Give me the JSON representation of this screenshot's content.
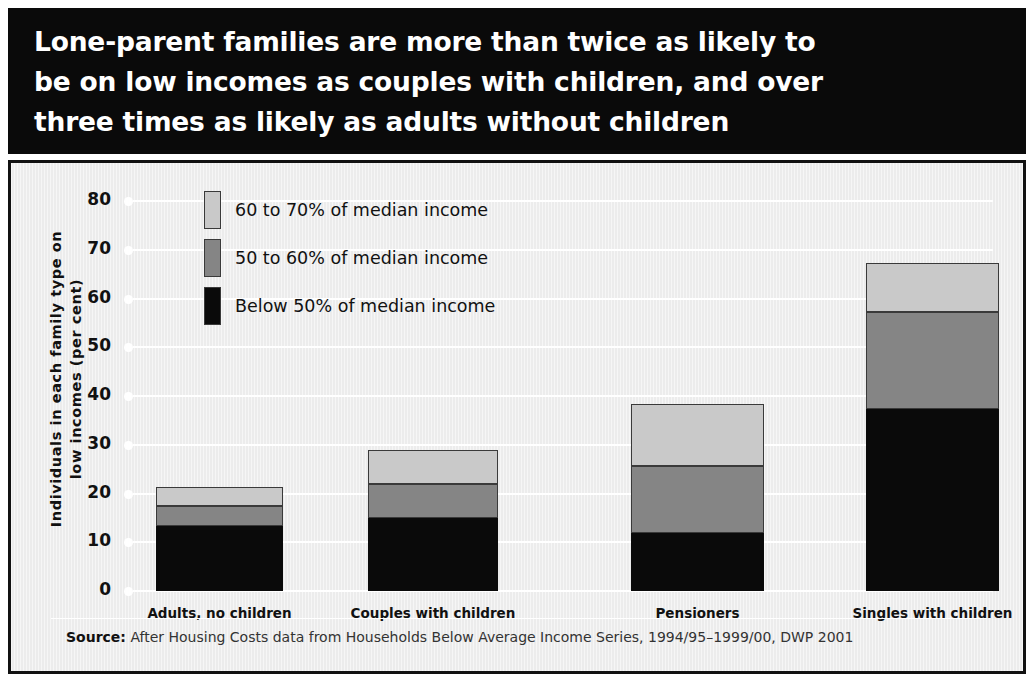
{
  "title": "Lone-parent families are more than twice as likely to\nbe on low incomes as couples with children, and over\nthree times as likely as adults without children",
  "ylabel": "Individuals in each family type on\nlow incomes (per cent)",
  "source_prefix": "Source:",
  "source_text": " After Housing Costs data from Households Below Average Income Series, 1994/95–1999/00, DWP 2001",
  "colors": {
    "banner_background": "#0a0a0a",
    "banner_text": "#ffffff",
    "plot_background": "#ececec",
    "gridline": "#ffffff",
    "frame_border": "#111111",
    "below_50": "#0a0a0a",
    "from_50_to_60": "#858585",
    "from_60_to_70": "#c9c9c9"
  },
  "chart_data": {
    "type": "bar",
    "subtype": "stacked-vertical",
    "title": "Lone-parent families are more than twice as likely to be on low incomes as couples with children, and over three times as likely as adults without children",
    "xlabel": "",
    "ylabel": "Individuals in each family type on low incomes (per cent)",
    "ylim": [
      0,
      80
    ],
    "yticks": [
      0,
      10,
      20,
      30,
      40,
      50,
      60,
      70,
      80
    ],
    "ytick_labels": [
      "0",
      "10",
      "20",
      "30",
      "40",
      "50",
      "60",
      "70",
      "80"
    ],
    "grid": true,
    "grid_axis": "y",
    "legend_position": "upper-left-inside",
    "categories": [
      "Adults, no children",
      "Couples with children",
      "Pensioners",
      "Singles with children"
    ],
    "series": [
      {
        "name": "Below 50% of median income",
        "color": "#0a0a0a",
        "values": [
          13.3,
          15.0,
          12.0,
          37.3
        ]
      },
      {
        "name": "50 to 60% of median income",
        "color": "#858585",
        "values": [
          4.2,
          7.0,
          13.7,
          19.9
        ]
      },
      {
        "name": "60 to 70% of median income",
        "color": "#c9c9c9",
        "values": [
          3.8,
          7.0,
          12.6,
          10.1
        ]
      }
    ],
    "totals": [
      21.3,
      29.0,
      38.3,
      67.3
    ],
    "source": "After Housing Costs data from Households Below Average Income Series, 1994/95–1999/00, DWP 2001"
  },
  "legend": {
    "items": [
      {
        "label": "60 to 70% of median income",
        "color": "#c9c9c9"
      },
      {
        "label": "50 to 60% of median income",
        "color": "#858585"
      },
      {
        "label": "Below 50% of median income",
        "color": "#0a0a0a"
      }
    ]
  }
}
